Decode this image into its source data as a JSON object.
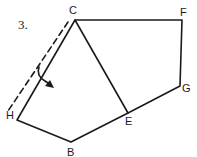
{
  "figure": {
    "problem_number": "3.",
    "vertices": {
      "C": {
        "label": "C",
        "x": 75,
        "y": 20
      },
      "F": {
        "label": "F",
        "x": 182,
        "y": 20
      },
      "G": {
        "label": "G",
        "x": 180,
        "y": 86
      },
      "E": {
        "label": "E",
        "x": 128,
        "y": 113
      },
      "B": {
        "label": "B",
        "x": 71,
        "y": 142
      },
      "H": {
        "label": "H",
        "x": 17,
        "y": 120
      }
    },
    "edges": [
      "C-F",
      "F-G",
      "G-E",
      "E-B",
      "B-H",
      "H-C",
      "C-E"
    ],
    "fold_line": {
      "style": "dashed",
      "parallel_to": "H-C"
    },
    "rotation_arrow": {
      "direction": "fold toward interior"
    },
    "colors": {
      "stroke": "#1a1a1a",
      "background": "#ffffff"
    }
  }
}
